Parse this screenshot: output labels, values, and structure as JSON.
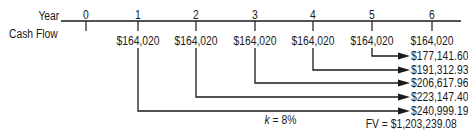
{
  "diagram": {
    "type": "cash-flow-timeline",
    "row_labels": {
      "year": "Year",
      "cash_flow": "Cash Flow"
    },
    "years": [
      "0",
      "1",
      "2",
      "3",
      "4",
      "5",
      "6"
    ],
    "cash_flows": [
      "",
      "$164,020",
      "$164,020",
      "$164,020",
      "$164,020",
      "$164,020",
      "$164,020"
    ],
    "future_values": [
      {
        "from_year": "5",
        "value": "$177,141.60"
      },
      {
        "from_year": "4",
        "value": "$191,312.93"
      },
      {
        "from_year": "3",
        "value": "$206,617.96"
      },
      {
        "from_year": "2",
        "value": "$223,147.40"
      },
      {
        "from_year": "1",
        "value": "$240,999.19"
      }
    ],
    "rate": {
      "variable": "k",
      "equals": " = 8%"
    },
    "total": "FV = $1,203,239.08",
    "colors": {
      "line": "#1a1a1a",
      "text": "#1a1a1a",
      "background": "#ffffff"
    }
  }
}
